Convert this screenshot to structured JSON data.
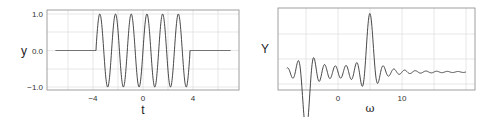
{
  "chart_data": [
    {
      "type": "line",
      "title": "",
      "xlabel": "t",
      "ylabel": "y",
      "xlim": [
        -7.7,
        7.7
      ],
      "ylim": [
        -1.1,
        1.1
      ],
      "x_ticks": [
        -4,
        0,
        4
      ],
      "x_tick_labels": [
        "−4",
        "0",
        "4"
      ],
      "y_ticks": [
        -1.0,
        0.0,
        1.0
      ],
      "y_tick_labels": [
        "−1.0",
        "0.0",
        "1.0"
      ],
      "grid": true,
      "legend": null,
      "series": [
        {
          "name": "windowed sinusoid",
          "description": "sin(5t) for |t| < 3.75, 0 otherwise; 6 cycles",
          "window": [
            -3.75,
            3.75
          ],
          "frequency": 5,
          "x": [
            -7,
            -3.75,
            -3.45,
            -3.14,
            -2.83,
            -2.51,
            -2.2,
            -1.88,
            -1.57,
            -1.26,
            -0.94,
            -0.63,
            -0.31,
            0,
            0.31,
            0.63,
            0.94,
            1.26,
            1.57,
            1.88,
            2.2,
            2.51,
            2.83,
            3.14,
            3.45,
            3.75,
            7
          ],
          "y": [
            0,
            0,
            1,
            0,
            -1,
            0,
            1,
            0,
            -1,
            0,
            1,
            0,
            -1,
            0,
            1,
            0,
            -1,
            0,
            1,
            0,
            -1,
            0,
            1,
            0,
            -1,
            0,
            0
          ]
        }
      ]
    },
    {
      "type": "line",
      "title": "",
      "xlabel": "ω",
      "ylabel": "Y",
      "xlim": [
        -9.4,
        21.4
      ],
      "x_ticks": [
        0,
        10
      ],
      "x_tick_labels": [
        "0",
        "10"
      ],
      "y_ticks": [],
      "grid": true,
      "legend": null,
      "series": [
        {
          "name": "spectrum",
          "description": "sinc-shaped main lobe centered at ω = 5 with decaying sidelobes",
          "peak_omega": 5,
          "omega_range": [
            -8,
            20
          ]
        }
      ]
    }
  ],
  "labels": {
    "left_ylabel": "y",
    "left_xlabel": "t",
    "right_ylabel": "Y",
    "right_xlabel": "ω",
    "left_yticks": [
      "1.0",
      "0.0",
      "−1.0"
    ],
    "left_xticks": [
      "−4",
      "0",
      "4"
    ],
    "right_xticks": [
      "0",
      "10"
    ]
  }
}
